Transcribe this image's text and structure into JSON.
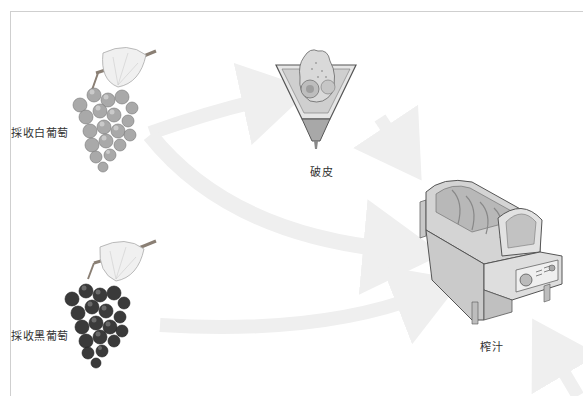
{
  "diagram": {
    "type": "process-flow",
    "steps": [
      {
        "id": "white-grapes",
        "label": "採收白葡萄"
      },
      {
        "id": "black-grapes",
        "label": "採收黑葡萄"
      },
      {
        "id": "crushing",
        "label": "破皮"
      },
      {
        "id": "pressing",
        "label": "榨汁"
      }
    ],
    "edges": [
      {
        "from": "white-grapes",
        "to": "crushing"
      },
      {
        "from": "white-grapes",
        "to": "pressing"
      },
      {
        "from": "crushing",
        "to": "pressing"
      },
      {
        "from": "black-grapes",
        "to": "pressing"
      },
      {
        "from": "offscreen",
        "to": "pressing"
      }
    ]
  },
  "colors": {
    "frame": "#cfcfcf",
    "arrow": "#efefef",
    "label": "#333333",
    "white_grape": "#9a9a9a",
    "black_grape": "#2e2e2e"
  }
}
